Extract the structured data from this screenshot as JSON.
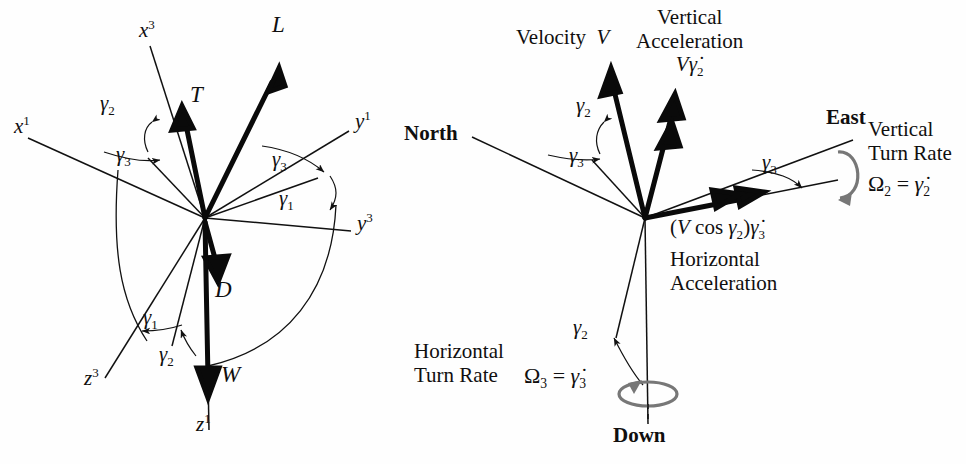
{
  "figure": {
    "type": "vector-diagram",
    "panels": 2,
    "background": "#ffffff",
    "stroke": "#111111",
    "turn_rate_arrow_color": "#6f6f6f"
  },
  "left_panel": {
    "name": "force-and-axes-diagram",
    "origin": {
      "x": 205,
      "y": 218
    },
    "axes": [
      {
        "id": "x1",
        "label_html": "x<sup>1</sup>",
        "tip": {
          "x": 26,
          "y": 137
        },
        "label_pos": {
          "x": 16,
          "y": 122
        }
      },
      {
        "id": "x3",
        "label_html": "x<sup>3</sup>",
        "tip": {
          "x": 148,
          "y": 43
        },
        "label_pos": {
          "x": 141,
          "y": 26
        }
      },
      {
        "id": "y1",
        "label_html": "y<sup>1</sup>",
        "tip": {
          "x": 351,
          "y": 129
        },
        "label_pos": {
          "x": 356,
          "y": 117
        }
      },
      {
        "id": "y3",
        "label_html": "y<sup>3</sup>",
        "tip": {
          "x": 353,
          "y": 232
        },
        "label_pos": {
          "x": 358,
          "y": 219
        }
      },
      {
        "id": "z1",
        "label_html": "z<sup>1</sup>",
        "tip": {
          "x": 210,
          "y": 434
        },
        "label_pos": {
          "x": 198,
          "y": 420
        }
      },
      {
        "id": "z3",
        "label_html": "z<sup>3</sup>",
        "tip": {
          "x": 102,
          "y": 381
        },
        "label_pos": {
          "x": 88,
          "y": 374
        }
      }
    ],
    "force_vectors": [
      {
        "id": "L",
        "label": "L",
        "label_html": "L",
        "tip": {
          "x": 279,
          "y": 70
        },
        "label_pos": {
          "x": 275,
          "y": 20
        },
        "heads": 1,
        "description": "Lift"
      },
      {
        "id": "T",
        "label": "T",
        "label_html": "T",
        "tip": {
          "x": 182,
          "y": 108
        },
        "label_pos": {
          "x": 192,
          "y": 92
        },
        "heads": 1,
        "description": "Thrust"
      },
      {
        "id": "D",
        "label": "D",
        "label_html": "D",
        "tip": {
          "x": 217,
          "y": 278
        },
        "label_pos": {
          "x": 217,
          "y": 285
        },
        "heads": 1,
        "description": "Drag"
      },
      {
        "id": "W",
        "label": "W",
        "label_html": "W",
        "tip": {
          "x": 208,
          "y": 395
        },
        "label_pos": {
          "x": 222,
          "y": 370
        },
        "heads": 1,
        "description": "Weight"
      }
    ],
    "angle_labels": [
      {
        "id": "gamma2-upper",
        "label_html": "&gamma;<sub>2</sub>",
        "pos": {
          "x": 110,
          "y": 101
        }
      },
      {
        "id": "gamma3-left",
        "label_html": "&gamma;<sub>3</sub>",
        "pos": {
          "x": 126,
          "y": 152
        }
      },
      {
        "id": "gamma3-right",
        "label_html": "&gamma;<sub>3</sub>",
        "pos": {
          "x": 281,
          "y": 157
        }
      },
      {
        "id": "gamma1-right",
        "label_html": "&gamma;<sub>1</sub>",
        "pos": {
          "x": 288,
          "y": 196
        }
      },
      {
        "id": "gamma1-lower",
        "label_html": "&gamma;<sub>1</sub>",
        "pos": {
          "x": 152,
          "y": 315
        }
      },
      {
        "id": "gamma2-lower",
        "label_html": "&gamma;<sub>2</sub>",
        "pos": {
          "x": 168,
          "y": 352
        }
      }
    ]
  },
  "right_panel": {
    "name": "navigation-frame-diagram",
    "origin": {
      "x": 645,
      "y": 218
    },
    "axes": [
      {
        "id": "north",
        "label": "North",
        "bold": true,
        "tip": {
          "x": 470,
          "y": 136
        },
        "label_pos": {
          "x": 408,
          "y": 126
        }
      },
      {
        "id": "east",
        "label": "East",
        "bold": true,
        "tip": {
          "x": 855,
          "y": 139
        },
        "label_pos": {
          "x": 830,
          "y": 114
        }
      },
      {
        "id": "down",
        "label": "Down",
        "bold": true,
        "tip": {
          "x": 648,
          "y": 430
        },
        "label_pos": {
          "x": 618,
          "y": 432
        }
      }
    ],
    "vectors": [
      {
        "id": "velocity",
        "label_html": "Velocity&nbsp;&nbsp;<i>V</i>",
        "tip": {
          "x": 611,
          "y": 70
        },
        "label_pos": {
          "x": 519,
          "y": 30
        },
        "heads": 1
      },
      {
        "id": "vertical-acceleration",
        "label_line1": "Vertical",
        "label_line2": "Acceleration",
        "label_html": "<i>V</i>&gamma;&#775;<sub>2</sub>",
        "tip": {
          "x": 674,
          "y": 96
        },
        "label_pos": {
          "x": 645,
          "y": 14
        },
        "heads": 2
      },
      {
        "id": "horizontal-acceleration",
        "label_html": "(<i>V</i> cos &gamma;<sub>2</sub>)&gamma;&#775;<sub>3</sub>",
        "label_line1": "Horizontal",
        "label_line2": "Acceleration",
        "tip": {
          "x": 760,
          "y": 194
        },
        "label_pos": {
          "x": 674,
          "y": 222
        },
        "heads": 2
      }
    ],
    "angle_labels": [
      {
        "id": "gamma2-upper",
        "label_html": "&gamma;<sub>2</sub>",
        "pos": {
          "x": 585,
          "y": 103
        }
      },
      {
        "id": "gamma3-left",
        "label_html": "&gamma;<sub>3</sub>",
        "pos": {
          "x": 578,
          "y": 153
        }
      },
      {
        "id": "gamma3-right",
        "label_html": "&gamma;<sub>3</sub>",
        "pos": {
          "x": 771,
          "y": 160
        }
      },
      {
        "id": "gamma2-lower",
        "label_html": "&gamma;<sub>2</sub>",
        "pos": {
          "x": 582,
          "y": 325
        }
      }
    ],
    "turn_rates": [
      {
        "id": "vertical-turn-rate",
        "line1": "Vertical",
        "line2": "Turn Rate",
        "equation_html": "&Omega;<sub>2</sub> = &gamma;&#775;<sub>2</sub>",
        "label_pos": {
          "x": 874,
          "y": 126
        },
        "equation_pos": {
          "x": 874,
          "y": 176
        },
        "spin_center": {
          "x": 846,
          "y": 175
        }
      },
      {
        "id": "horizontal-turn-rate",
        "line1": "Horizontal",
        "line2": "Turn Rate",
        "equation_html": "&Omega;<sub>3</sub> = &gamma;&#775;<sub>3</sub>",
        "label_pos": {
          "x": 418,
          "y": 348
        },
        "equation_pos": {
          "x": 528,
          "y": 372
        },
        "spin_center": {
          "x": 648,
          "y": 390
        }
      }
    ]
  }
}
